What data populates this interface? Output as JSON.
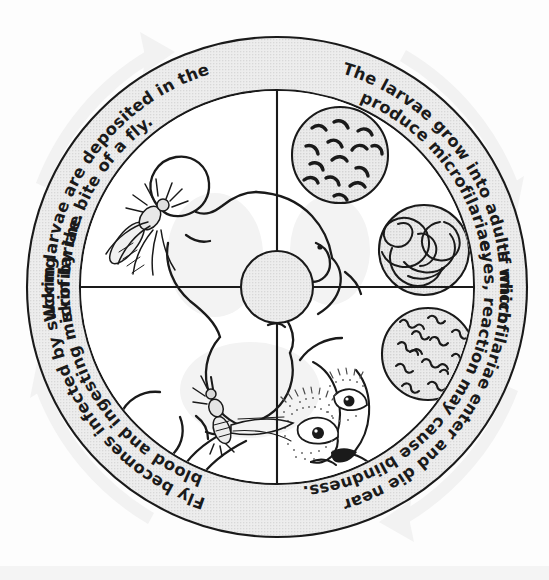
{
  "diagram": {
    "type": "circular-cycle-diagram",
    "background_color": "#fdfdfd",
    "ring": {
      "band_fill": "#e8e8e8",
      "band_stroke": "#1a1a1a",
      "outer_radius": 250,
      "inner_radius": 197,
      "center_x": 277,
      "center_y": 287
    },
    "hub": {
      "fill": "#e4e4e4",
      "stroke": "#1a1a1a",
      "radius": 36
    },
    "quadrants": [
      {
        "id": "top-left",
        "position": "top-left",
        "caption_line_1": "Worm larvae are deposited in the",
        "caption_line_2": "skin by the bite of a fly.",
        "illustration": "fly biting the shoulder of a reclining human figure"
      },
      {
        "id": "top-right",
        "position": "top-right",
        "caption_line_1": "The larvae grow into adults which",
        "caption_line_2": "produce microfilariae.",
        "illustration": "inset circle of larvae and inset circle of tangled adult worms"
      },
      {
        "id": "bottom-right",
        "position": "bottom-right",
        "caption_line_1": "If microfilariae enter and die near",
        "caption_line_2": "eyes, reaction may cause blindness.",
        "illustration": "stippled human face with eyes and inset circle of microfilariae"
      },
      {
        "id": "bottom-left",
        "position": "bottom-left",
        "caption_line_1": "Fly becomes infected by sucking",
        "caption_line_2": "blood and ingesting microfilariae.",
        "illustration": "black fly feeding on the leg of the human figure"
      }
    ],
    "inset_circles": [
      {
        "id": "larvae",
        "label": "larvae",
        "fill": "#e6e6e6",
        "stroke": "#1a1a1a"
      },
      {
        "id": "adult-worms",
        "label": "adult worms",
        "fill": "#e6e6e6",
        "stroke": "#1a1a1a"
      },
      {
        "id": "microfilariae",
        "label": "microfilariae",
        "fill": "#e6e6e6",
        "stroke": "#1a1a1a"
      }
    ],
    "flow_arrows": {
      "direction": "clockwise",
      "count": 4,
      "color": "#f0f0f0",
      "description": "four faint light-grey curved arrows outside the ring indicating clockwise flow"
    }
  }
}
